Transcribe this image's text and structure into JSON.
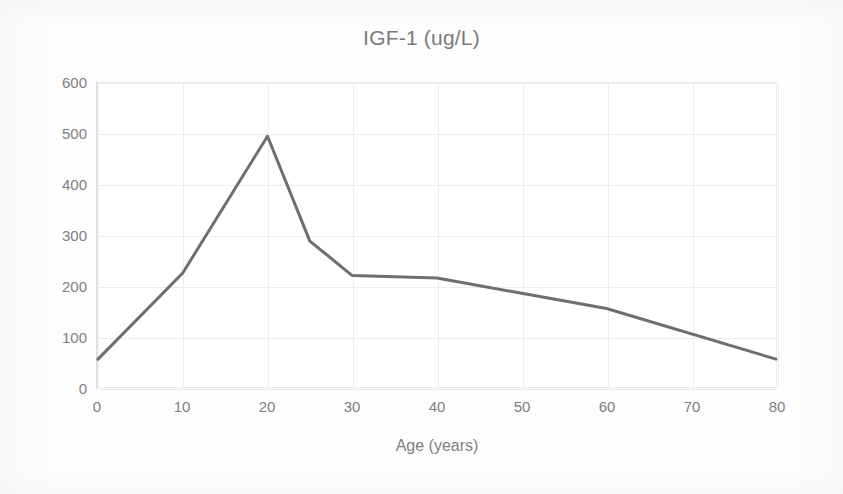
{
  "chart_data": {
    "type": "line",
    "title": "IGF-1 (ug/L)",
    "xlabel": "Age (years)",
    "ylabel": "",
    "x": [
      0,
      10,
      20,
      25,
      30,
      40,
      50,
      60,
      80
    ],
    "values": [
      55,
      225,
      495,
      288,
      220,
      215,
      185,
      155,
      55
    ],
    "series": [
      {
        "name": "IGF-1",
        "x": [
          0,
          10,
          20,
          25,
          30,
          40,
          50,
          60,
          80
        ],
        "values": [
          55,
          225,
          495,
          288,
          220,
          215,
          185,
          155,
          55
        ]
      }
    ],
    "xlim": [
      0,
      80
    ],
    "ylim": [
      0,
      600
    ],
    "x_ticks": [
      "0",
      "10",
      "20",
      "30",
      "40",
      "50",
      "60",
      "70",
      "80"
    ],
    "x_tick_values": [
      0,
      10,
      20,
      30,
      40,
      50,
      60,
      70,
      80
    ],
    "y_ticks": [
      "0",
      "100",
      "200",
      "300",
      "400",
      "500",
      "600"
    ],
    "y_tick_values": [
      0,
      100,
      200,
      300,
      400,
      500,
      600
    ],
    "grid": true,
    "legend": false,
    "legend_position": "none",
    "colors": {
      "line": "#6E6E6E",
      "grid": "#ECECEC",
      "axis": "#D9D9D9",
      "text": "#7F7F7F",
      "title_text": "#7A7A7A",
      "background": "#FDFDFD",
      "plot_background": "#FFFFFF"
    },
    "line_width": 3
  }
}
